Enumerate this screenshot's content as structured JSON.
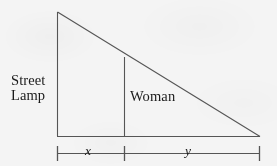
{
  "figure": {
    "background_color": "#f4f4f4",
    "line_color": "#555555",
    "text_color": "#1a1a1a",
    "labels": {
      "street_lamp_line1": "Street",
      "street_lamp_line2": "Lamp",
      "woman": "Woman",
      "x_segment": "x",
      "y_segment": "y"
    },
    "geometry": {
      "apex": {
        "x": 57,
        "y": 12
      },
      "base_left": {
        "x": 57,
        "y": 136
      },
      "base_right": {
        "x": 260,
        "y": 136
      },
      "woman_foot": {
        "x": 124,
        "y": 136
      },
      "woman_top": {
        "x": 124,
        "y": 57
      },
      "measure_line_y": 153,
      "tick_top_y": 146,
      "tick_bottom_y": 160
    }
  }
}
